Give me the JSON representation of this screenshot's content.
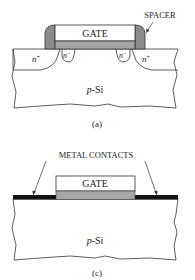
{
  "diagrams": [
    {
      "id": "a",
      "caption": "(a)",
      "gate_label": "GATE",
      "spacer_label": "SPACER",
      "substrate_label_italic": "p",
      "substrate_label_rest": "-Si",
      "regions": {
        "n_plus_left": {
          "base": "n",
          "sup": "+"
        },
        "n_minus_left": {
          "base": "n",
          "sup": "−"
        },
        "n_minus_right": {
          "base": "n",
          "sup": "−"
        },
        "n_plus_right": {
          "base": "n",
          "sup": "+"
        }
      }
    },
    {
      "id": "c",
      "caption": "(c)",
      "gate_label": "GATE",
      "contacts_label": "METAL CONTACTS",
      "substrate_label_italic": "p",
      "substrate_label_rest": "-Si"
    }
  ],
  "colors": {
    "outline": "#333333",
    "spacer": "#8c8c8c",
    "gate_oxide": "#a6a6a6",
    "metal": "#111111",
    "background": "#ffffff"
  }
}
